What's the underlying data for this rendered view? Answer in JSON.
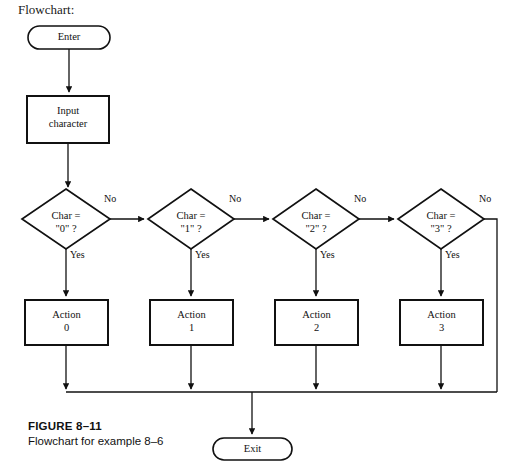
{
  "page": {
    "heading": "Flowchart:",
    "background": "#ffffff",
    "line_color": "#111111",
    "width": 521,
    "height": 474
  },
  "figure": {
    "number": "FIGURE 8–11",
    "description": "Flowchart for example 8–6"
  },
  "terminals": {
    "start": "Enter",
    "end": "Exit"
  },
  "process": {
    "input_line1": "Input",
    "input_line2": "character"
  },
  "decisions": [
    {
      "line1": "Char =",
      "line2": "\"0\" ?",
      "yes": "Yes",
      "no": "No"
    },
    {
      "line1": "Char =",
      "line2": "\"1\" ?",
      "yes": "Yes",
      "no": "No"
    },
    {
      "line1": "Char =",
      "line2": "\"2\" ?",
      "yes": "Yes",
      "no": "No"
    },
    {
      "line1": "Char =",
      "line2": "\"3\" ?",
      "yes": "Yes",
      "no": "No"
    }
  ],
  "actions": [
    {
      "line1": "Action",
      "line2": "0"
    },
    {
      "line1": "Action",
      "line2": "1"
    },
    {
      "line1": "Action",
      "line2": "2"
    },
    {
      "line1": "Action",
      "line2": "3"
    }
  ]
}
